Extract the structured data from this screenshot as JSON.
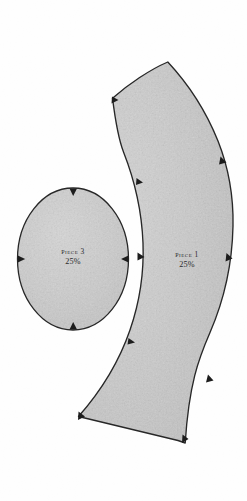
{
  "document": {
    "title": "Quilted Hat pp368–9",
    "type": "sewing-pattern-sheet",
    "background_color": "#ffffff"
  },
  "style": {
    "piece_fill": "#c9c9c9",
    "piece_outline": "#1c1c1c",
    "notch_color": "#111111",
    "text_color": "#2a2a2a"
  },
  "pieces": [
    {
      "id": "piece-1",
      "name": "Piece 1",
      "scale": "25%",
      "shape": "curved-band",
      "label_position": {
        "x": 187,
        "y": 258
      },
      "notch_count": 8
    },
    {
      "id": "piece-3",
      "name": "Piece 3",
      "scale": "25%",
      "shape": "oval",
      "label_position": {
        "x": 73,
        "y": 258
      },
      "notch_count": 4
    }
  ]
}
